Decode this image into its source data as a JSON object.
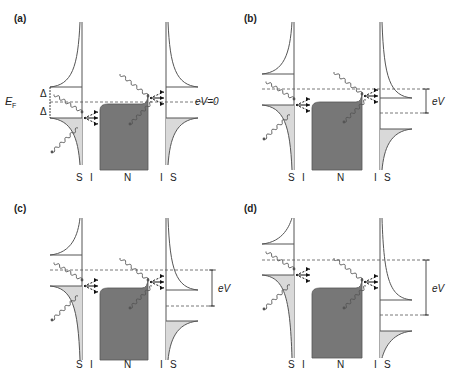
{
  "figure": {
    "colors": {
      "line": "#555555",
      "n_fill": "#777777",
      "s_fill": "#d9d9d9",
      "dash": "#555555",
      "text": "#222222"
    },
    "panels": [
      {
        "id": "a",
        "label": "(a)",
        "ox": 0,
        "oy": 0,
        "layer_labels": [
          "S",
          "I",
          "N",
          "I",
          "S"
        ],
        "left_s": {
          "x": 82,
          "gap_top": 87,
          "gap_bot": 118,
          "top": 22,
          "bottom": 165
        },
        "n": {
          "x0": 100,
          "x1": 148,
          "top": 104,
          "bottom": 170,
          "bump": true
        },
        "right_s": {
          "x": 166,
          "gap_top": 87,
          "gap_bot": 118,
          "top": 22,
          "bottom": 165
        },
        "dash_left": 102,
        "dash_right": 102,
        "ef_label": "E",
        "ef_sub": "F",
        "delta_label": "Δ",
        "ev_label": "eV=0",
        "show_ev_bracket": false
      },
      {
        "id": "b",
        "label": "(b)",
        "ox": 230,
        "oy": 0,
        "layer_labels": [
          "S",
          "I",
          "N",
          "I",
          "S"
        ],
        "left_s": {
          "x": 64,
          "gap_top": 74,
          "gap_bot": 105,
          "top": 22,
          "bottom": 170
        },
        "n": {
          "x0": 82,
          "x1": 132,
          "top": 102,
          "bottom": 170,
          "bump": true
        },
        "right_s": {
          "x": 150,
          "gap_top": 98,
          "gap_bot": 129,
          "top": 22,
          "bottom": 170
        },
        "dash_left": 89,
        "dash_right": 113,
        "ev_label": "eV",
        "show_ev_bracket": true
      },
      {
        "id": "c",
        "label": "(c)",
        "ox": 0,
        "oy": 190,
        "layer_labels": [
          "S",
          "I",
          "N",
          "I",
          "S"
        ],
        "left_s": {
          "x": 82,
          "gap_top": 65,
          "gap_bot": 96,
          "top": 28,
          "bottom": 170
        },
        "n": {
          "x0": 100,
          "x1": 148,
          "top": 98,
          "bottom": 170,
          "bump": true
        },
        "right_s": {
          "x": 166,
          "gap_top": 100,
          "gap_bot": 131,
          "top": 28,
          "bottom": 170
        },
        "dash_left": 80,
        "dash_right": 116,
        "ev_label": "eV",
        "show_ev_bracket": true
      },
      {
        "id": "d",
        "label": "(d)",
        "ox": 230,
        "oy": 190,
        "layer_labels": [
          "S",
          "I",
          "N",
          "I",
          "S"
        ],
        "left_s": {
          "x": 64,
          "gap_top": 54,
          "gap_bot": 85,
          "top": 28,
          "bottom": 168
        },
        "n": {
          "x0": 82,
          "x1": 132,
          "top": 98,
          "bottom": 168,
          "bump": true
        },
        "right_s": {
          "x": 150,
          "gap_top": 110,
          "gap_bot": 141,
          "top": 28,
          "bottom": 168
        },
        "dash_left": 70,
        "dash_right": 125,
        "ev_label": "eV",
        "show_ev_bracket": true
      }
    ]
  }
}
